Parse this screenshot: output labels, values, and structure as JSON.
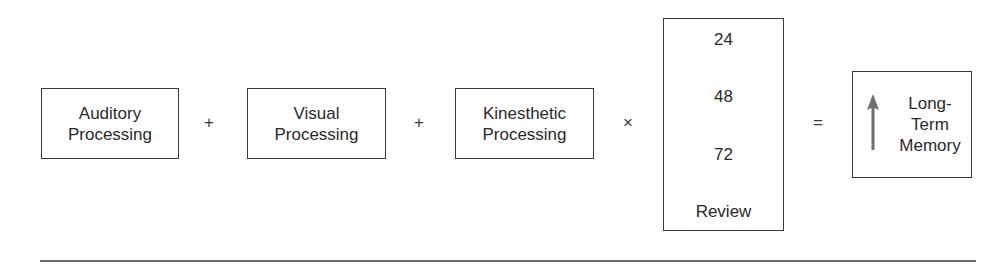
{
  "diagram": {
    "boxes": {
      "auditory": {
        "line1": "Auditory",
        "line2": "Processing"
      },
      "visual": {
        "line1": "Visual",
        "line2": "Processing"
      },
      "kinesthetic": {
        "line1": "Kinesthetic",
        "line2": "Processing"
      },
      "review": {
        "values": [
          "24",
          "48",
          "72"
        ],
        "label": "Review"
      },
      "memory": {
        "line1": "Long-",
        "line2": "Term",
        "line3": "Memory",
        "icon": "up-arrow-icon"
      }
    },
    "operators": {
      "plus1": "+",
      "plus2": "+",
      "times": "×",
      "equals": "="
    },
    "colors": {
      "border": "#3a3a3a",
      "arrow": "#6e6e6e",
      "text": "#2a2a2a"
    }
  }
}
